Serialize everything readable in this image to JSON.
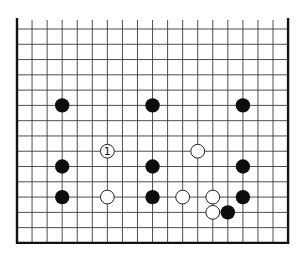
{
  "diagram": {
    "type": "go-board-fragment",
    "grid": {
      "columns": 19,
      "rows": 15,
      "origin_x": 17,
      "origin_y": 29,
      "spacing_x": 15.06,
      "spacing_y": 15.28,
      "open_edge": "top",
      "line_color": "#3a3a3a",
      "edge_color": "#111111"
    },
    "stones": [
      {
        "color": "black",
        "col": 3,
        "row": 5
      },
      {
        "color": "black",
        "col": 9,
        "row": 5
      },
      {
        "color": "black",
        "col": 15,
        "row": 5
      },
      {
        "color": "white",
        "col": 6,
        "row": 8,
        "label": "1"
      },
      {
        "color": "white",
        "col": 12,
        "row": 8
      },
      {
        "color": "black",
        "col": 3,
        "row": 9
      },
      {
        "color": "black",
        "col": 9,
        "row": 9
      },
      {
        "color": "black",
        "col": 15,
        "row": 9
      },
      {
        "color": "black",
        "col": 3,
        "row": 11
      },
      {
        "color": "white",
        "col": 6,
        "row": 11
      },
      {
        "color": "black",
        "col": 9,
        "row": 11
      },
      {
        "color": "white",
        "col": 11,
        "row": 11
      },
      {
        "color": "white",
        "col": 13,
        "row": 11
      },
      {
        "color": "black",
        "col": 15,
        "row": 11
      },
      {
        "color": "white",
        "col": 13,
        "row": 12
      },
      {
        "color": "black",
        "col": 14,
        "row": 12
      }
    ],
    "colors": {
      "black_stone": "#0d0d0d",
      "white_stone_fill": "#ffffff",
      "white_stone_stroke": "#222222",
      "background": "#ffffff"
    }
  }
}
